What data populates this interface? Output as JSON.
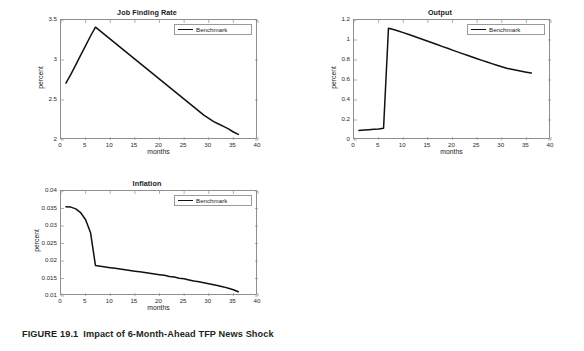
{
  "figure": {
    "caption_number": "FIGURE 19.1",
    "caption_text": "Impact of 6-Month-Ahead TFP News Shock",
    "background_color": "#ffffff",
    "line_color": "#111111",
    "axis_color": "#8f8f8f"
  },
  "panels": [
    {
      "id": "job-finding-rate",
      "title": "Job Finding Rate",
      "legend_label": "Benchmark"
    },
    {
      "id": "output",
      "title": "Output",
      "legend_label": "Benchmark"
    },
    {
      "id": "inflation",
      "title": "Inflation",
      "legend_label": "Benchmark"
    }
  ],
  "chart_data": [
    {
      "type": "line",
      "title": "Job Finding Rate",
      "xlabel": "months",
      "ylabel": "percent",
      "xlim": [
        0,
        40
      ],
      "ylim": [
        2,
        3.5
      ],
      "xticks": [
        0,
        5,
        10,
        15,
        20,
        25,
        30,
        35,
        40
      ],
      "yticks": [
        2,
        2.5,
        3,
        3.5
      ],
      "ytick_labels": [
        "2",
        "2.5",
        "3",
        "3.5"
      ],
      "grid": false,
      "legend": [
        "Benchmark"
      ],
      "legend_position": "top-right",
      "series": [
        {
          "name": "Benchmark",
          "x": [
            1,
            2,
            3,
            4,
            5,
            6,
            7,
            8,
            9,
            10,
            11,
            12,
            13,
            14,
            15,
            16,
            17,
            18,
            19,
            20,
            21,
            22,
            23,
            24,
            25,
            26,
            27,
            28,
            29,
            30,
            31,
            32,
            33,
            34,
            35,
            36
          ],
          "values": [
            2.71,
            2.82,
            2.94,
            3.06,
            3.18,
            3.3,
            3.41,
            3.36,
            3.31,
            3.26,
            3.21,
            3.16,
            3.11,
            3.06,
            3.01,
            2.96,
            2.91,
            2.86,
            2.81,
            2.76,
            2.71,
            2.66,
            2.61,
            2.56,
            2.51,
            2.46,
            2.41,
            2.36,
            2.31,
            2.27,
            2.23,
            2.2,
            2.17,
            2.14,
            2.1,
            2.07
          ]
        }
      ]
    },
    {
      "type": "line",
      "title": "Output",
      "xlabel": "months",
      "ylabel": "percent",
      "xlim": [
        0,
        40
      ],
      "ylim": [
        0,
        1.2
      ],
      "xticks": [
        0,
        5,
        10,
        15,
        20,
        25,
        30,
        35,
        40
      ],
      "yticks": [
        0,
        0.2,
        0.4,
        0.6,
        0.8,
        1,
        1.2
      ],
      "ytick_labels": [
        "0",
        "0.2",
        "0.4",
        "0.6",
        "0.8",
        "1",
        "1.2"
      ],
      "grid": false,
      "legend": [
        "Benchmark"
      ],
      "legend_position": "top-right",
      "series": [
        {
          "name": "Benchmark",
          "x": [
            1,
            2,
            3,
            4,
            5,
            6,
            7,
            8,
            9,
            10,
            11,
            12,
            13,
            14,
            15,
            16,
            17,
            18,
            19,
            20,
            21,
            22,
            23,
            24,
            25,
            26,
            27,
            28,
            29,
            30,
            31,
            32,
            33,
            34,
            35,
            36
          ],
          "values": [
            0.096,
            0.1,
            0.103,
            0.107,
            0.111,
            0.118,
            1.118,
            1.105,
            1.09,
            1.074,
            1.057,
            1.04,
            1.023,
            1.005,
            0.988,
            0.97,
            0.952,
            0.934,
            0.917,
            0.899,
            0.881,
            0.864,
            0.847,
            0.83,
            0.813,
            0.796,
            0.78,
            0.764,
            0.748,
            0.733,
            0.718,
            0.707,
            0.697,
            0.687,
            0.678,
            0.669
          ]
        }
      ]
    },
    {
      "type": "line",
      "title": "Inflation",
      "xlabel": "months",
      "ylabel": "percent",
      "xlim": [
        0,
        40
      ],
      "ylim": [
        0.01,
        0.04
      ],
      "xticks": [
        0,
        5,
        10,
        15,
        20,
        25,
        30,
        35,
        40
      ],
      "yticks": [
        0.01,
        0.015,
        0.02,
        0.025,
        0.03,
        0.035,
        0.04
      ],
      "ytick_labels": [
        "0.01",
        "0.015",
        "0.02",
        "0.025",
        "0.03",
        "0.035",
        "0.04"
      ],
      "grid": false,
      "legend": [
        "Benchmark"
      ],
      "legend_position": "top-right",
      "series": [
        {
          "name": "Benchmark",
          "x": [
            1,
            2,
            3,
            4,
            5,
            6,
            7,
            8,
            9,
            10,
            11,
            12,
            13,
            14,
            15,
            16,
            17,
            18,
            19,
            20,
            21,
            22,
            23,
            24,
            25,
            26,
            27,
            28,
            29,
            30,
            31,
            32,
            33,
            34,
            35,
            36
          ],
          "values": [
            0.0355,
            0.0354,
            0.0349,
            0.0338,
            0.0318,
            0.0281,
            0.0187,
            0.0185,
            0.0183,
            0.0181,
            0.0179,
            0.0177,
            0.0175,
            0.0173,
            0.0171,
            0.0169,
            0.0167,
            0.0165,
            0.0163,
            0.0161,
            0.0159,
            0.0156,
            0.0154,
            0.0151,
            0.0149,
            0.0146,
            0.0143,
            0.0141,
            0.0138,
            0.0135,
            0.0132,
            0.0129,
            0.0126,
            0.0122,
            0.0118,
            0.0112
          ]
        }
      ]
    }
  ]
}
